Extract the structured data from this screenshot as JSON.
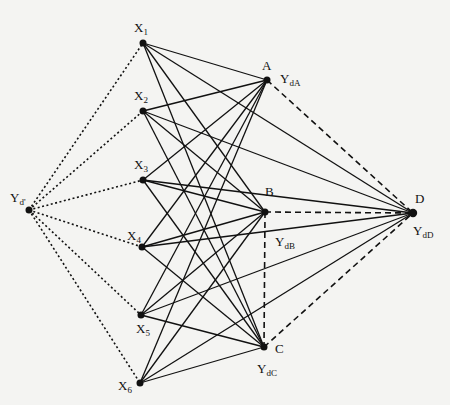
{
  "diagram": {
    "nodes": [
      {
        "id": "Yd",
        "label": "Y",
        "sub": "d'",
        "x": 29,
        "y": 210,
        "lx": 10,
        "ly": 202
      },
      {
        "id": "X1",
        "label": "X",
        "sub": "1",
        "x": 143,
        "y": 43,
        "lx": 134,
        "ly": 32
      },
      {
        "id": "X2",
        "label": "X",
        "sub": "2",
        "x": 143,
        "y": 111,
        "lx": 134,
        "ly": 100
      },
      {
        "id": "X3",
        "label": "X",
        "sub": "3",
        "x": 143,
        "y": 180,
        "lx": 134,
        "ly": 169
      },
      {
        "id": "X4",
        "label": "X",
        "sub": "4",
        "x": 142,
        "y": 247,
        "lx": 127,
        "ly": 240
      },
      {
        "id": "X5",
        "label": "X",
        "sub": "5",
        "x": 141,
        "y": 315,
        "lx": 136,
        "ly": 333
      },
      {
        "id": "X6",
        "label": "X",
        "sub": "6",
        "x": 140,
        "y": 383,
        "lx": 118,
        "ly": 390
      },
      {
        "id": "A",
        "label": "A",
        "sub": "",
        "x": 267,
        "y": 80,
        "lx": 262,
        "ly": 70
      },
      {
        "id": "B",
        "label": "B",
        "sub": "",
        "x": 265,
        "y": 212,
        "lx": 265,
        "ly": 196
      },
      {
        "id": "C",
        "label": "C",
        "sub": "",
        "x": 264,
        "y": 347,
        "lx": 275,
        "ly": 353
      },
      {
        "id": "D",
        "label": "D",
        "sub": "",
        "x": 413,
        "y": 213,
        "lx": 415,
        "ly": 203
      }
    ],
    "extra_labels": [
      {
        "label": "Y",
        "sub": "dA",
        "x": 280,
        "y": 83
      },
      {
        "label": "Y",
        "sub": "dB",
        "x": 275,
        "y": 246
      },
      {
        "label": "Y",
        "sub": "dC",
        "x": 257,
        "y": 373
      },
      {
        "label": "Y",
        "sub": "dD",
        "x": 413,
        "y": 235
      }
    ],
    "edges": [
      {
        "from": "Yd",
        "to": "X1",
        "style": "dotted"
      },
      {
        "from": "Yd",
        "to": "X2",
        "style": "dotted"
      },
      {
        "from": "Yd",
        "to": "X3",
        "style": "dotted"
      },
      {
        "from": "Yd",
        "to": "X4",
        "style": "dotted"
      },
      {
        "from": "Yd",
        "to": "X5",
        "style": "dotted"
      },
      {
        "from": "Yd",
        "to": "X6",
        "style": "dotted"
      },
      {
        "from": "X1",
        "to": "A",
        "style": "solid"
      },
      {
        "from": "X1",
        "to": "B",
        "style": "solid"
      },
      {
        "from": "X1",
        "to": "C",
        "style": "solid"
      },
      {
        "from": "X1",
        "to": "D",
        "style": "solid"
      },
      {
        "from": "X2",
        "to": "A",
        "style": "solid"
      },
      {
        "from": "X2",
        "to": "B",
        "style": "solid"
      },
      {
        "from": "X2",
        "to": "C",
        "style": "solid"
      },
      {
        "from": "X2",
        "to": "D",
        "style": "solid"
      },
      {
        "from": "X3",
        "to": "A",
        "style": "solid"
      },
      {
        "from": "X3",
        "to": "B",
        "style": "solid"
      },
      {
        "from": "X3",
        "to": "C",
        "style": "solid"
      },
      {
        "from": "X3",
        "to": "D",
        "style": "solid"
      },
      {
        "from": "X4",
        "to": "A",
        "style": "solid"
      },
      {
        "from": "X4",
        "to": "B",
        "style": "solid"
      },
      {
        "from": "X4",
        "to": "C",
        "style": "solid"
      },
      {
        "from": "X4",
        "to": "D",
        "style": "solid"
      },
      {
        "from": "X5",
        "to": "A",
        "style": "solid"
      },
      {
        "from": "X5",
        "to": "B",
        "style": "solid"
      },
      {
        "from": "X5",
        "to": "C",
        "style": "solid"
      },
      {
        "from": "X5",
        "to": "D",
        "style": "solid"
      },
      {
        "from": "X6",
        "to": "A",
        "style": "solid"
      },
      {
        "from": "X6",
        "to": "B",
        "style": "solid"
      },
      {
        "from": "X6",
        "to": "C",
        "style": "solid"
      },
      {
        "from": "X6",
        "to": "D",
        "style": "solid"
      },
      {
        "from": "A",
        "to": "D",
        "style": "dashed"
      },
      {
        "from": "B",
        "to": "D",
        "style": "dashed"
      },
      {
        "from": "C",
        "to": "D",
        "style": "dashed"
      },
      {
        "from": "B",
        "to": "C",
        "style": "dashed"
      }
    ],
    "colors": {
      "line": "#111111",
      "background": "#f4f4f2"
    }
  }
}
